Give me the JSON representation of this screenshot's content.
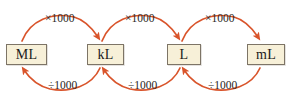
{
  "diagram": {
    "colors": {
      "background": "#ffffff",
      "box_fill": "#f7f0d8",
      "box_border": "#7d7466",
      "arrow": "#d9542b",
      "text": "#1b1b1b"
    },
    "units": [
      {
        "id": "ML",
        "label": "ML",
        "x": 6,
        "y": 44,
        "w": 41,
        "h": 21
      },
      {
        "id": "kL",
        "label": "kL",
        "x": 87,
        "y": 44,
        "w": 37,
        "h": 21
      },
      {
        "id": "L",
        "label": "L",
        "x": 167,
        "y": 44,
        "w": 34,
        "h": 21
      },
      {
        "id": "mL",
        "label": "mL",
        "x": 247,
        "y": 44,
        "w": 38,
        "h": 21
      }
    ],
    "multiply_arrows": [
      {
        "id": "ML-to-kL",
        "label": "×1000",
        "from": "ML",
        "to": "kL",
        "label_x": 45,
        "label_y": 13
      },
      {
        "id": "kL-to-L",
        "label": "×1000",
        "from": "kL",
        "to": "L",
        "label_x": 125,
        "label_y": 13
      },
      {
        "id": "L-to-mL",
        "label": "×1000",
        "from": "L",
        "to": "mL",
        "label_x": 205,
        "label_y": 13
      }
    ],
    "divide_arrows": [
      {
        "id": "kL-to-ML",
        "label": "÷1000",
        "from": "kL",
        "to": "ML",
        "label_x": 48,
        "label_y": 80
      },
      {
        "id": "L-to-kL",
        "label": "÷1000",
        "from": "L",
        "to": "kL",
        "label_x": 128,
        "label_y": 80
      },
      {
        "id": "mL-to-L",
        "label": "÷1000",
        "from": "mL",
        "to": "L",
        "label_x": 208,
        "label_y": 80
      }
    ]
  }
}
